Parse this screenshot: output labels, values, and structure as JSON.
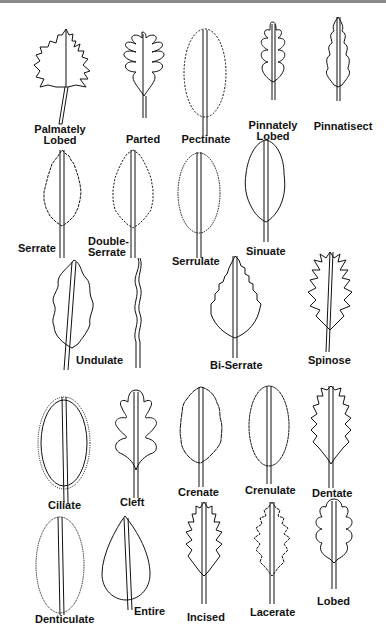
{
  "colors": {
    "background": "#ffffff",
    "stroke": "#111111",
    "top_border": "#8a8a8a"
  },
  "leaves": [
    {
      "id": "palmately-lobed",
      "label": "Palmately\nLobed"
    },
    {
      "id": "parted",
      "label": "Parted"
    },
    {
      "id": "pectinate",
      "label": "Pectinate"
    },
    {
      "id": "pinnately-lobed",
      "label": "Pinnately\nLobed"
    },
    {
      "id": "pinnatisect",
      "label": "Pinnatisect"
    },
    {
      "id": "serrate",
      "label": "Serrate"
    },
    {
      "id": "double-serrate",
      "label": "Double-\nSerrate"
    },
    {
      "id": "serrulate",
      "label": "Serrulate"
    },
    {
      "id": "sinuate",
      "label": "Sinuate"
    },
    {
      "id": "undulate",
      "label": "Undulate"
    },
    {
      "id": "bi-serrate",
      "label": "Bi-Serrate"
    },
    {
      "id": "spinose",
      "label": "Spinose"
    },
    {
      "id": "ciliate",
      "label": "Ciliate"
    },
    {
      "id": "cleft",
      "label": "Cleft"
    },
    {
      "id": "crenate",
      "label": "Crenate"
    },
    {
      "id": "crenulate",
      "label": "Crenulate"
    },
    {
      "id": "dentate",
      "label": "Dentate"
    },
    {
      "id": "denticulate",
      "label": "Denticulate"
    },
    {
      "id": "entire",
      "label": "Entire"
    },
    {
      "id": "incised",
      "label": "Incised"
    },
    {
      "id": "lacerate",
      "label": "Lacerate"
    },
    {
      "id": "lobed",
      "label": "Lobed"
    }
  ]
}
